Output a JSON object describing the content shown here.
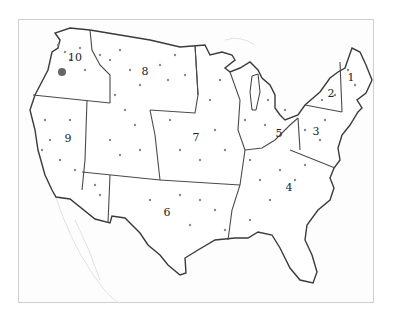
{
  "map": {
    "title": "",
    "frame_color": "#cfcfcf",
    "outline_color": "#3a3a3a",
    "boundary_color": "#4a4a4a",
    "dot_color": "#8a8a8a",
    "regions": [
      {
        "id": "1",
        "label": "1",
        "x": 351,
        "y": 77
      },
      {
        "id": "2",
        "label": "2",
        "x": 331,
        "y": 93
      },
      {
        "id": "3",
        "label": "3",
        "x": 316,
        "y": 131
      },
      {
        "id": "4",
        "label": "4",
        "x": 289,
        "y": 187
      },
      {
        "id": "5",
        "label": "5",
        "x": 279,
        "y": 133
      },
      {
        "id": "6",
        "label": "6",
        "x": 167,
        "y": 212
      },
      {
        "id": "7",
        "label": "7",
        "x": 196,
        "y": 137
      },
      {
        "id": "8",
        "label": "8",
        "x": 145,
        "y": 71
      },
      {
        "id": "9",
        "label": "9",
        "x": 68,
        "y": 138
      },
      {
        "id": "10",
        "label": "10",
        "x": 75,
        "y": 57
      }
    ]
  }
}
